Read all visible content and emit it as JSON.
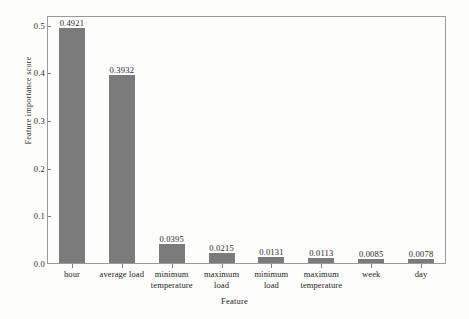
{
  "chart_data": {
    "type": "bar",
    "title": "",
    "xlabel": "Feature",
    "ylabel": "Feature importance score",
    "categories": [
      "hour",
      "average load",
      "minimum temperature",
      "maximum load",
      "minimum load",
      "maximum temperature",
      "week",
      "day"
    ],
    "values": [
      0.4921,
      0.3932,
      0.0395,
      0.0215,
      0.0131,
      0.0113,
      0.0085,
      0.0078
    ],
    "data_labels": [
      "0.4921",
      "0.3932",
      "0.0395",
      "0.0215",
      "0.0131",
      "0.0113",
      "0.0085",
      "0.0078"
    ],
    "ylim": [
      0.0,
      0.52
    ],
    "yticks": [
      0.0,
      0.1,
      0.2,
      0.3,
      0.4,
      0.5
    ],
    "ytick_labels": [
      "0.0",
      "0.1",
      "0.2",
      "0.3",
      "0.4",
      "0.5"
    ],
    "grid": false,
    "legend": null,
    "bar_color": "#7b7b7b",
    "axis_color": "#9a9a9a",
    "frame": "box"
  },
  "figure": {
    "caption_partial": ""
  }
}
